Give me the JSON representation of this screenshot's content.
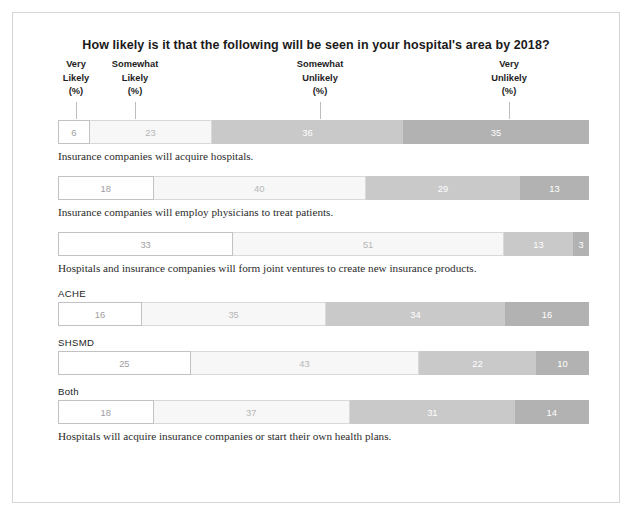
{
  "chart_data": {
    "type": "bar",
    "subtype": "stacked-horizontal-100",
    "title": "How likely is it that the following will be seen in your hospital's area by 2018?",
    "xlabel": "",
    "ylabel": "",
    "xlim": [
      0,
      100
    ],
    "grid": false,
    "legend_position": "top",
    "categories": [
      "Insurance companies will acquire hospitals.",
      "Insurance companies will employ physicians to treat patients.",
      "Hospitals and insurance companies will form joint ventures to create new insurance products.",
      "Hospitals will acquire insurance companies or start their own health plans. — ACHE",
      "Hospitals will acquire insurance companies or start their own health plans. — SHSMD",
      "Hospitals will acquire insurance companies or start their own health plans. — Both"
    ],
    "series": [
      {
        "name": "Very Likely (%)",
        "values": [
          6,
          18,
          33,
          16,
          25,
          18
        ]
      },
      {
        "name": "Somewhat Likely (%)",
        "values": [
          23,
          40,
          51,
          35,
          43,
          37
        ]
      },
      {
        "name": "Somewhat Unlikely (%)",
        "values": [
          36,
          29,
          13,
          34,
          22,
          31
        ]
      },
      {
        "name": "Very Unlikely (%)",
        "values": [
          35,
          13,
          3,
          16,
          10,
          14
        ]
      }
    ],
    "series_colors": [
      "#ffffff",
      "#f7f7f7",
      "#c9c9c9",
      "#b2b2b2"
    ]
  },
  "headers": [
    {
      "line1": "Very",
      "line2": "Likely",
      "line3": "(%)"
    },
    {
      "line1": "Somewhat",
      "line2": "Likely",
      "line3": "(%)"
    },
    {
      "line1": "Somewhat",
      "line2": "Unlikely",
      "line3": "(%)"
    },
    {
      "line1": "Very",
      "line2": "Unlikely",
      "line3": "(%)"
    }
  ],
  "bars": [
    {
      "group_label": "",
      "values": [
        6,
        23,
        36,
        35
      ],
      "caption": "Insurance companies will acquire hospitals."
    },
    {
      "group_label": "",
      "values": [
        18,
        40,
        29,
        13
      ],
      "caption": "Insurance companies will employ physicians to treat patients."
    },
    {
      "group_label": "",
      "values": [
        33,
        51,
        13,
        3
      ],
      "caption": "Hospitals and insurance companies will form joint ventures to create new insurance products."
    },
    {
      "group_label": "ACHE",
      "values": [
        16,
        35,
        34,
        16
      ],
      "caption": ""
    },
    {
      "group_label": "SHSMD",
      "values": [
        25,
        43,
        22,
        10
      ],
      "caption": ""
    },
    {
      "group_label": "Both",
      "values": [
        18,
        37,
        31,
        14
      ],
      "caption": "Hospitals will acquire insurance companies or start their own health plans."
    }
  ]
}
